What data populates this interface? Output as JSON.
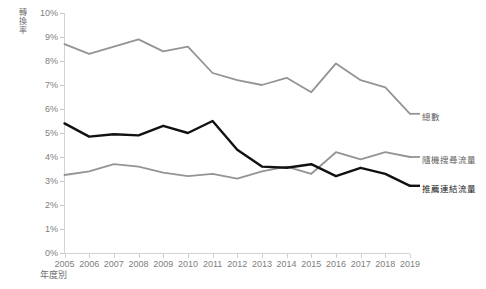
{
  "chart_data": {
    "type": "line",
    "title": "",
    "xlabel": "年度別",
    "ylabel": "轉換率",
    "x": [
      2005,
      2006,
      2007,
      2008,
      2009,
      2010,
      2011,
      2012,
      2013,
      2014,
      2015,
      2016,
      2017,
      2018,
      2019
    ],
    "xtick_labels": [
      "2005",
      "2006",
      "2007",
      "2008",
      "2009",
      "2010",
      "2011",
      "2012",
      "2013",
      "2014",
      "2015",
      "2016",
      "2017",
      "2018",
      "2019"
    ],
    "ytick_labels": [
      "0%",
      "1%",
      "2%",
      "3%",
      "4%",
      "5%",
      "6%",
      "7%",
      "8%",
      "9%",
      "10%"
    ],
    "ytick_values": [
      0,
      1,
      2,
      3,
      4,
      5,
      6,
      7,
      8,
      9,
      10
    ],
    "ylim": [
      0,
      10
    ],
    "grid": false,
    "legend_position": "right-inline",
    "series": [
      {
        "name": "總數",
        "color": "#949494",
        "width": 1.8,
        "values": [
          8.7,
          8.3,
          8.6,
          8.9,
          8.4,
          8.6,
          7.5,
          7.2,
          7.0,
          7.3,
          6.7,
          7.9,
          7.2,
          6.9,
          5.8
        ]
      },
      {
        "name": "隨機搜尋流量",
        "color": "#949494",
        "width": 1.8,
        "values": [
          3.25,
          3.4,
          3.7,
          3.6,
          3.35,
          3.2,
          3.3,
          3.1,
          3.4,
          3.6,
          3.3,
          4.2,
          3.9,
          4.2,
          4.0
        ]
      },
      {
        "name": "推薦連結流量",
        "color": "#111111",
        "width": 2.4,
        "values": [
          5.4,
          4.85,
          4.95,
          4.9,
          5.3,
          5.0,
          5.5,
          4.3,
          3.6,
          3.55,
          3.7,
          3.2,
          3.55,
          3.3,
          2.8
        ]
      }
    ],
    "labels_text": {
      "total": "總數",
      "organic": "隨機搜尋流量",
      "referral": "推薦連結流量"
    }
  },
  "axis": {
    "y_title_chars": [
      "轉",
      "換",
      "率"
    ]
  }
}
